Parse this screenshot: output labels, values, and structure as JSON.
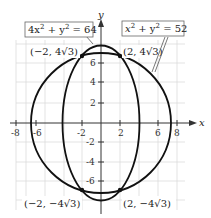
{
  "diagram": {
    "type": "graph",
    "axes": {
      "x_label": "x",
      "y_label": "y",
      "x_ticks": [
        "-8",
        "-6",
        "-2",
        "2",
        "6",
        "8"
      ],
      "y_ticks": [
        "6",
        "4",
        "2",
        "-2",
        "-4",
        "-6"
      ]
    },
    "curves": [
      {
        "name": "ellipse",
        "equation": "4x² + y² = 64",
        "eq_lhs_a": "4x",
        "eq_sup1": "2",
        "eq_mid": " + y",
        "eq_sup2": "2",
        "eq_rhs": " = 64"
      },
      {
        "name": "circle",
        "equation": "x² + y² = 52",
        "eq_lhs_a": "x",
        "eq_sup1": "2",
        "eq_mid": " + y",
        "eq_sup2": "2",
        "eq_rhs": " = 52"
      }
    ],
    "intersection_points": [
      {
        "label": "(−2, 4√3)",
        "x": -2,
        "y": "4√3"
      },
      {
        "label": "(2, 4√3)",
        "x": 2,
        "y": "4√3"
      },
      {
        "label": "(−2, −4√3)",
        "x": -2,
        "y": "-4√3"
      },
      {
        "label": "(2, −4√3)",
        "x": 2,
        "y": "-4√3"
      }
    ],
    "colors": {
      "curve": "#111111",
      "grid": "#d9d9d9",
      "axis": "#333333"
    }
  }
}
